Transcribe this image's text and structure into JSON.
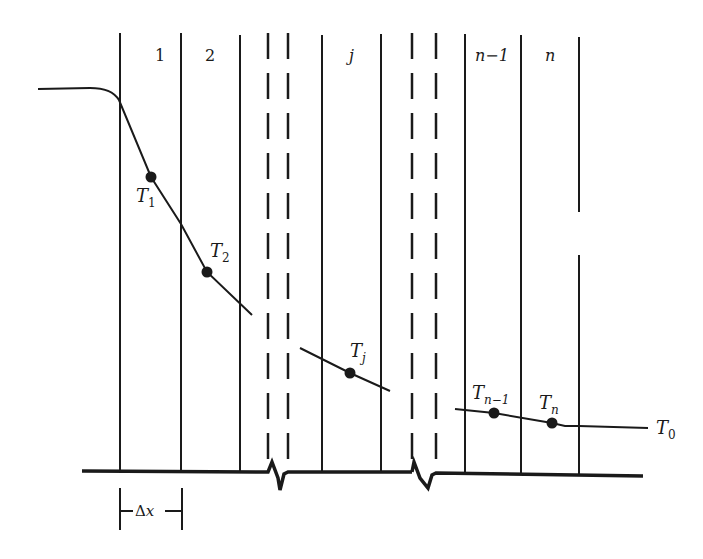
{
  "diagram": {
    "type": "finite-difference temperature distribution (slab divided into nodes)",
    "node_labels": {
      "n1": "1",
      "n2": "2",
      "nj": "j",
      "nn1": "n−1",
      "nn": "n"
    },
    "point_labels": {
      "T1": {
        "base": "T",
        "sub": "1"
      },
      "T2": {
        "base": "T",
        "sub": "2"
      },
      "Tj": {
        "base": "T",
        "sub": "j"
      },
      "Tn1": {
        "base": "T",
        "sub": "n−1"
      },
      "Tn": {
        "base": "T",
        "sub": "n"
      },
      "T0": {
        "base": "T",
        "sub": "0"
      }
    },
    "dimension": {
      "label": "Δx"
    },
    "colors": {
      "ink": "#1a1a1a",
      "background": "#ffffff"
    }
  }
}
